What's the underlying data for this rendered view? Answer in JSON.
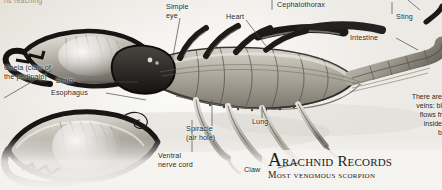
{
  "page": {
    "width": 442,
    "height": 190,
    "background_color": "#f3f2ef",
    "ink_color": "#2a2a2a"
  },
  "top_caption": {
    "text": "ns reaching"
  },
  "labels": [
    {
      "id": "chela",
      "text": "Chela (claw of\nthe pedipalp)"
    },
    {
      "id": "brain",
      "text": "Brain"
    },
    {
      "id": "esophagus",
      "text": "Esophagus"
    },
    {
      "id": "simple-eye",
      "text": "Simple\neye"
    },
    {
      "id": "heart",
      "text": "Heart"
    },
    {
      "id": "cephalothorax",
      "text": "Cephalothorax"
    },
    {
      "id": "sting",
      "text": "Sting"
    },
    {
      "id": "intestine",
      "text": "Intestine"
    },
    {
      "id": "lung",
      "text": "Lung"
    },
    {
      "id": "spiracle",
      "text": "Spiracle\n(air hole)"
    },
    {
      "id": "ventral-nerve-cord",
      "text": "Ventral\nnerve cord"
    },
    {
      "id": "claw",
      "text": "Claw"
    }
  ],
  "sidenote": {
    "text": "There are\nveins: bl\nflows fr\ninside\nb"
  },
  "records": {
    "heading_first_letter": "A",
    "heading_rest": "rachnid Records",
    "subheading": "Most venomous scorpion"
  }
}
